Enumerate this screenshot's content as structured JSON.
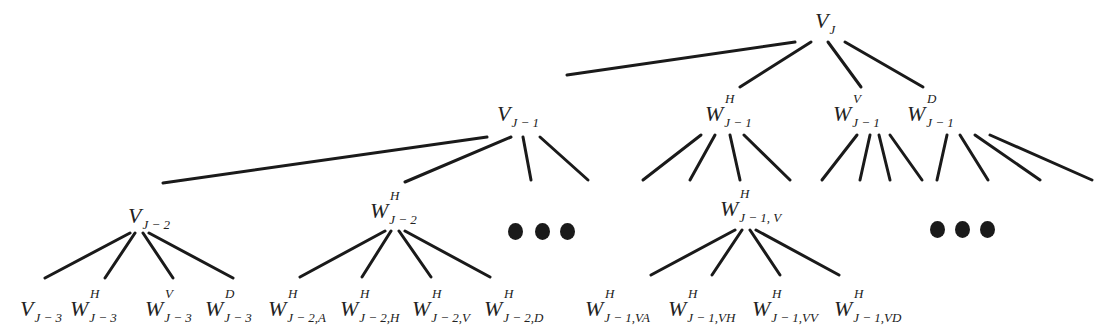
{
  "diagram": {
    "type": "wavelet-packet-decomposition-tree",
    "root": {
      "base": "V",
      "sup": "",
      "sub": "J",
      "x": 815,
      "y": 10
    },
    "level1": [
      {
        "id": "v-j-1",
        "base": "V",
        "sup": "",
        "sub": "J − 1",
        "x": 497,
        "y": 103
      },
      {
        "id": "w-h-j-1",
        "base": "W",
        "sup": "H",
        "sub": "J − 1",
        "x": 705,
        "y": 103
      },
      {
        "id": "w-v-j-1",
        "base": "W",
        "sup": "V",
        "sub": "J − 1",
        "x": 833,
        "y": 103
      },
      {
        "id": "w-d-j-1",
        "base": "W",
        "sup": "D",
        "sub": "J − 1",
        "x": 907,
        "y": 103
      }
    ],
    "level2": [
      {
        "id": "v-j-2",
        "base": "V",
        "sup": "",
        "sub": "J − 2",
        "x": 128,
        "y": 205
      },
      {
        "id": "w-h-j-2",
        "base": "W",
        "sup": "H",
        "sub": "J − 2",
        "x": 370,
        "y": 200
      },
      {
        "id": "w-h-j-1-v",
        "base": "W",
        "sup": "H",
        "sub": "J − 1, V",
        "x": 720,
        "y": 198
      }
    ],
    "level3": [
      {
        "id": "v-j-3",
        "base": "V",
        "sup": "",
        "sub": "J − 3",
        "x": 20,
        "y": 298
      },
      {
        "id": "w-h-j-3",
        "base": "W",
        "sup": "H",
        "sub": "J − 3",
        "x": 70,
        "y": 298
      },
      {
        "id": "w-v-j-3",
        "base": "W",
        "sup": "V",
        "sub": "J − 3",
        "x": 145,
        "y": 298
      },
      {
        "id": "w-d-j-3",
        "base": "W",
        "sup": "D",
        "sub": "J − 3",
        "x": 205,
        "y": 298
      },
      {
        "id": "w-h-j-2-a",
        "base": "W",
        "sup": "H",
        "sub": "J − 2,A",
        "x": 268,
        "y": 298
      },
      {
        "id": "w-h-j-2-h",
        "base": "W",
        "sup": "H",
        "sub": "J − 2,H",
        "x": 340,
        "y": 298
      },
      {
        "id": "w-h-j-2-v",
        "base": "W",
        "sup": "H",
        "sub": "J − 2,V",
        "x": 412,
        "y": 298
      },
      {
        "id": "w-h-j-2-d",
        "base": "W",
        "sup": "H",
        "sub": "J − 2,D",
        "x": 484,
        "y": 298
      },
      {
        "id": "w-h-j-1-va",
        "base": "W",
        "sup": "H",
        "sub": "J − 1,VA",
        "x": 585,
        "y": 298
      },
      {
        "id": "w-h-j-1-vh",
        "base": "W",
        "sup": "H",
        "sub": "J − 1,VH",
        "x": 668,
        "y": 298
      },
      {
        "id": "w-h-j-1-vv",
        "base": "W",
        "sup": "H",
        "sub": "J − 1,VV",
        "x": 752,
        "y": 298
      },
      {
        "id": "w-h-j-1-vd",
        "base": "W",
        "sup": "H",
        "sub": "J − 1,VD",
        "x": 834,
        "y": 298
      }
    ],
    "ellipses": [
      {
        "id": "ellipsis-1",
        "dots": [
          [
            508,
            223
          ],
          [
            535,
            223
          ],
          [
            560,
            223
          ]
        ]
      },
      {
        "id": "ellipsis-2",
        "dots": [
          [
            930,
            221
          ],
          [
            955,
            221
          ],
          [
            980,
            221
          ]
        ]
      }
    ],
    "edges": [
      [
        795,
        42,
        567,
        75
      ],
      [
        811,
        42,
        740,
        87
      ],
      [
        828,
        42,
        861,
        87
      ],
      [
        845,
        42,
        923,
        87
      ],
      [
        487,
        137,
        163,
        183
      ],
      [
        511,
        137,
        405,
        182
      ],
      [
        523,
        137,
        531,
        180
      ],
      [
        540,
        137,
        588,
        180
      ],
      [
        701,
        135,
        643,
        180
      ],
      [
        715,
        135,
        690,
        180
      ],
      [
        730,
        135,
        740,
        180
      ],
      [
        744,
        135,
        790,
        180
      ],
      [
        857,
        135,
        822,
        180
      ],
      [
        870,
        135,
        860,
        180
      ],
      [
        879,
        135,
        890,
        180
      ],
      [
        890,
        135,
        922,
        180
      ],
      [
        947,
        135,
        937,
        180
      ],
      [
        960,
        135,
        988,
        180
      ],
      [
        975,
        135,
        1040,
        180
      ],
      [
        990,
        135,
        1092,
        180
      ],
      [
        130,
        233,
        45,
        278
      ],
      [
        135,
        233,
        105,
        278
      ],
      [
        143,
        233,
        173,
        278
      ],
      [
        149,
        233,
        233,
        278
      ],
      [
        385,
        231,
        300,
        277
      ],
      [
        391,
        231,
        362,
        277
      ],
      [
        399,
        231,
        431,
        277
      ],
      [
        405,
        231,
        490,
        277
      ],
      [
        735,
        230,
        651,
        275
      ],
      [
        742,
        230,
        712,
        275
      ],
      [
        750,
        230,
        780,
        275
      ],
      [
        756,
        230,
        839,
        275
      ]
    ],
    "edge_color": "#1a1a1a"
  }
}
